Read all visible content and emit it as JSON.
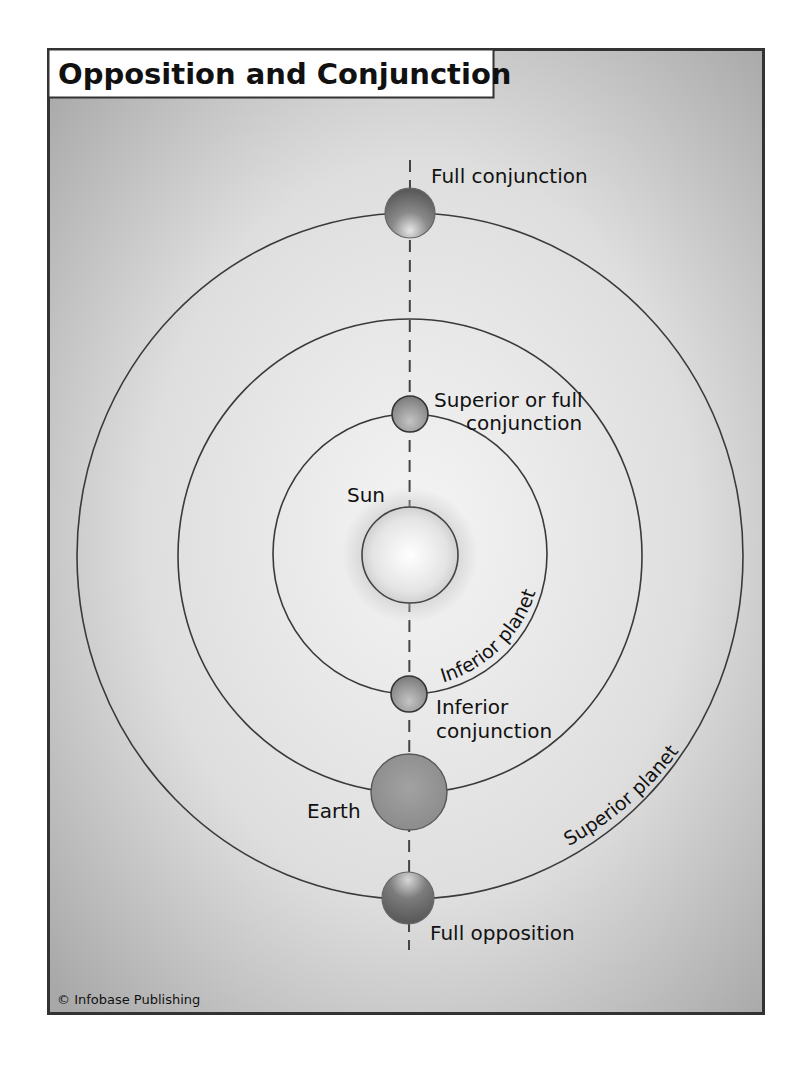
{
  "title": "Opposition and Conjunction",
  "credit": "© Infobase Publishing",
  "labels": {
    "full_conjunction": "Full conjunction",
    "superior_conjunction_line1": "Superior or full",
    "superior_conjunction_line2": "conjunction",
    "sun": "Sun",
    "inferior_planet_orbit": "Inferior planet",
    "inferior_conjunction_line1": "Inferior",
    "inferior_conjunction_line2": "conjunction",
    "earth": "Earth",
    "superior_planet_orbit": "Superior planet",
    "full_opposition": "Full opposition"
  },
  "colors": {
    "frame_border": "#333333",
    "background_light": "#f0f0f0",
    "background_dark": "#a9a9a9",
    "orbit_line": "#3a3a3a",
    "sun_fill": "#e8e8e8",
    "planet_dark": "#6e6e6e",
    "planet_mid": "#9a9a9a",
    "title_box": "#ffffff"
  },
  "orbits": [
    {
      "name": "inferior-planet-orbit",
      "cx": 410,
      "cy": 554,
      "rx": 137,
      "ry": 140
    },
    {
      "name": "earth-orbit",
      "cx": 410,
      "cy": 556,
      "rx": 232,
      "ry": 237
    },
    {
      "name": "superior-planet-orbit",
      "cx": 410,
      "cy": 556,
      "rx": 333,
      "ry": 343
    }
  ],
  "bodies": [
    {
      "name": "full-conjunction-planet",
      "cx": 410,
      "cy": 213,
      "r": 25
    },
    {
      "name": "superior-conjunction-planet",
      "cx": 410,
      "cy": 414,
      "r": 18
    },
    {
      "name": "sun",
      "cx": 410,
      "cy": 555,
      "r": 48
    },
    {
      "name": "inferior-conjunction-planet",
      "cx": 409,
      "cy": 694,
      "r": 18
    },
    {
      "name": "earth",
      "cx": 409,
      "cy": 792,
      "r": 38
    },
    {
      "name": "full-opposition-planet",
      "cx": 408,
      "cy": 898,
      "r": 26
    }
  ]
}
